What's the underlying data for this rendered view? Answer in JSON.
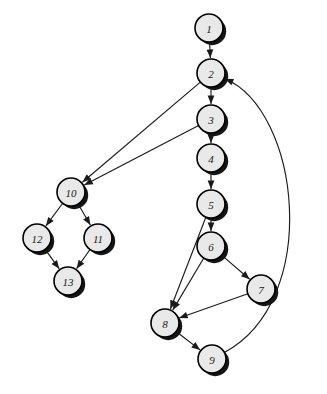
{
  "diagram": {
    "type": "directed-graph",
    "width": 327,
    "height": 394,
    "background_color": "#ffffff",
    "node_fill_color": "#e9e9e9",
    "node_stroke_color": "#000000",
    "node_shadow_color": "#151515",
    "edge_color": "#1a1a1a",
    "node_radius": 14,
    "nodes": [
      {
        "id": "1",
        "label": "1",
        "cx": 209,
        "cy": 28
      },
      {
        "id": "2",
        "label": "2",
        "cx": 211,
        "cy": 73
      },
      {
        "id": "3",
        "label": "3",
        "cx": 211,
        "cy": 119
      },
      {
        "id": "4",
        "label": "4",
        "cx": 211,
        "cy": 158
      },
      {
        "id": "5",
        "label": "5",
        "cx": 211,
        "cy": 204
      },
      {
        "id": "6",
        "label": "6",
        "cx": 211,
        "cy": 246
      },
      {
        "id": "7",
        "label": "7",
        "cx": 261,
        "cy": 289
      },
      {
        "id": "8",
        "label": "8",
        "cx": 165,
        "cy": 323
      },
      {
        "id": "9",
        "label": "9",
        "cx": 212,
        "cy": 359
      },
      {
        "id": "10",
        "label": "10",
        "cx": 71,
        "cy": 192
      },
      {
        "id": "11",
        "label": "11",
        "cx": 98,
        "cy": 238
      },
      {
        "id": "12",
        "label": "12",
        "cx": 37,
        "cy": 238
      },
      {
        "id": "13",
        "label": "13",
        "cx": 68,
        "cy": 281
      }
    ],
    "edges": [
      {
        "from": "1",
        "to": "2",
        "shape": "straight"
      },
      {
        "from": "2",
        "to": "3",
        "shape": "straight"
      },
      {
        "from": "2",
        "to": "10",
        "shape": "straight"
      },
      {
        "from": "3",
        "to": "4",
        "shape": "straight"
      },
      {
        "from": "3",
        "to": "10",
        "shape": "straight"
      },
      {
        "from": "4",
        "to": "5",
        "shape": "straight"
      },
      {
        "from": "5",
        "to": "6",
        "shape": "straight"
      },
      {
        "from": "5",
        "to": "8",
        "shape": "straight"
      },
      {
        "from": "6",
        "to": "7",
        "shape": "straight"
      },
      {
        "from": "6",
        "to": "8",
        "shape": "straight"
      },
      {
        "from": "7",
        "to": "8",
        "shape": "straight"
      },
      {
        "from": "8",
        "to": "9",
        "shape": "straight"
      },
      {
        "from": "9",
        "to": "2",
        "shape": "curve",
        "control": [
          322,
          300,
          300,
          110
        ]
      },
      {
        "from": "10",
        "to": "11",
        "shape": "straight"
      },
      {
        "from": "10",
        "to": "12",
        "shape": "straight"
      },
      {
        "from": "11",
        "to": "13",
        "shape": "straight"
      },
      {
        "from": "12",
        "to": "13",
        "shape": "straight"
      }
    ]
  }
}
